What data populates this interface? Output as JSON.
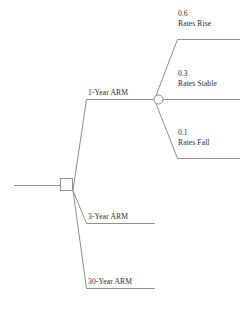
{
  "diagram": {
    "type": "decision-tree",
    "title": "",
    "line_color": "#8e8e92",
    "text_color": "#2b2b2b",
    "background": "#ffffff"
  },
  "nodes": {
    "decision_node": {
      "shape": "square",
      "name": "decision-node"
    },
    "chance_node": {
      "shape": "circle",
      "name": "chance-node"
    }
  },
  "decision_branches": [
    {
      "label": "1-Year ARM"
    },
    {
      "label": "3-Year ARM"
    },
    {
      "label": "30-Year ARM"
    }
  ],
  "chance_branches": [
    {
      "probability": "0.6",
      "label": "Rates Rise"
    },
    {
      "probability": "0.3",
      "label": "Rates Stable"
    },
    {
      "probability": "0.1",
      "label": "Rates Fall"
    }
  ]
}
